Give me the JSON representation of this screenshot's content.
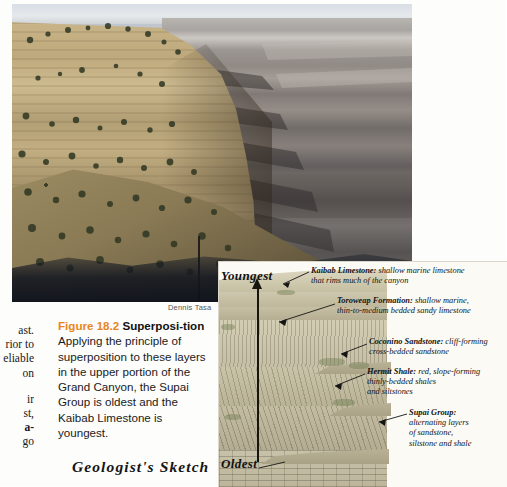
{
  "figure": {
    "photo_credit": "Dennis Tasa",
    "caption_number": "Figure 18.2",
    "caption_title": "Superposi-",
    "caption_title_cont": "tion",
    "caption_body": " Applying the principle of superposition to these layers in the upper portion of the Grand Canyon, the Supai Group is oldest and the Kaibab Limestone is youngest.",
    "sketch_title": "Geologist's Sketch"
  },
  "bleed_text": {
    "line1": "ast.",
    "line2": "rior to",
    "line3": "eliable",
    "line4": "on",
    "line5": "ir",
    "line6": "st,",
    "line7": "a-",
    "line8": "go"
  },
  "sketch": {
    "arrow_top_label": "Youngest",
    "arrow_bottom_label": "Oldest",
    "annotations": [
      {
        "id": "kaibab",
        "name": "Kaibab Limestone:",
        "line1": " shallow marine limestone",
        "line2": "that rims much of the canyon"
      },
      {
        "id": "toroweap",
        "name": "Toroweap Formation:",
        "line1": " shallow marine,",
        "line2": "thin-to-medium bedded sandy limestone"
      },
      {
        "id": "coconino",
        "name": "Coconino Sandstone:",
        "line1": " cliff-forming",
        "line2": "cross-bedded sandstone"
      },
      {
        "id": "hermit",
        "name": "Hermit Shale:",
        "line1": " red, slope-forming",
        "line2": "thinly-bedded shales",
        "line3": "and siltstones"
      },
      {
        "id": "supai",
        "name": "Supai Group:",
        "line1": "alternating layers",
        "line2": "of sandstone,",
        "line3": "siltstone and shale"
      }
    ]
  },
  "colors": {
    "accent_orange": "#e8861e",
    "ink": "#131313",
    "sketch_paper": "#fbfaf5"
  }
}
